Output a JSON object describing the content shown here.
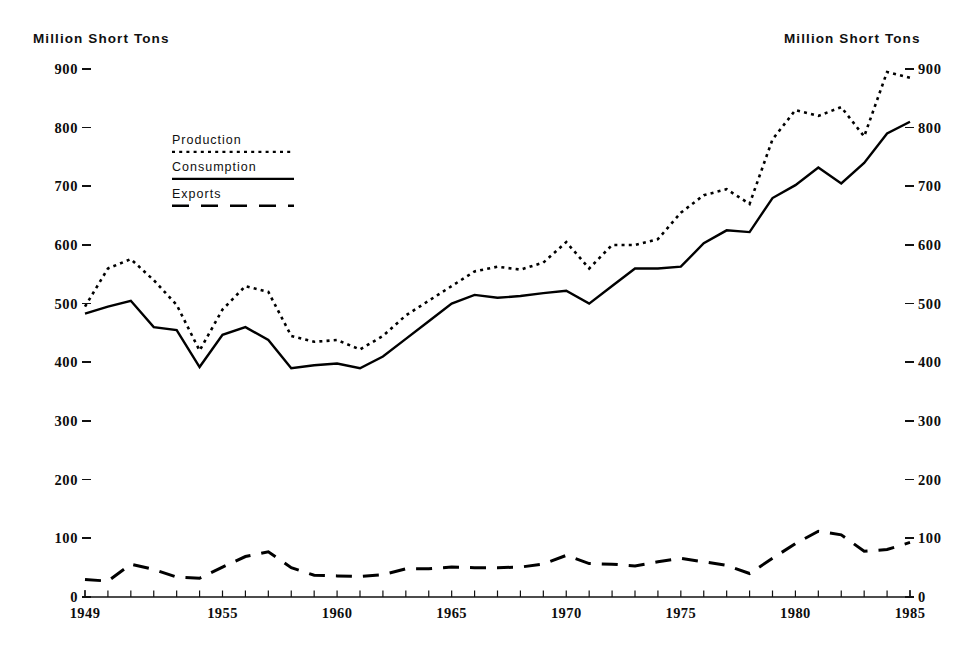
{
  "axis_titles": {
    "left": "Million Short Tons",
    "right": "Million Short Tons"
  },
  "legend": {
    "items": [
      {
        "label": "Production",
        "style": "dotted",
        "color": "#000000"
      },
      {
        "label": "Consumption",
        "style": "solid",
        "color": "#000000"
      },
      {
        "label": "Exports",
        "style": "dashed",
        "color": "#000000"
      }
    ]
  },
  "y_axis": {
    "ticks": [
      "0",
      "100",
      "200",
      "300",
      "400",
      "500",
      "600",
      "700",
      "800",
      "900"
    ],
    "min": 0,
    "max": 900
  },
  "x_axis": {
    "labeled_ticks": [
      "1949",
      "1955",
      "1960",
      "1965",
      "1970",
      "1975",
      "1980",
      "1985"
    ],
    "min": 1949,
    "max": 1985
  },
  "chart_data": {
    "type": "line",
    "title": "",
    "subtitle": "",
    "xlabel": "",
    "ylabel": "Million Short Tons",
    "xlim": [
      1949,
      1985
    ],
    "ylim": [
      0,
      900
    ],
    "grid": false,
    "legend_position": "upper-left",
    "x": [
      1949,
      1950,
      1951,
      1952,
      1953,
      1954,
      1955,
      1956,
      1957,
      1958,
      1959,
      1960,
      1961,
      1962,
      1963,
      1964,
      1965,
      1966,
      1967,
      1968,
      1969,
      1970,
      1971,
      1972,
      1973,
      1974,
      1975,
      1976,
      1977,
      1978,
      1979,
      1980,
      1981,
      1982,
      1983,
      1984,
      1985
    ],
    "series": [
      {
        "name": "Production",
        "style": "dotted",
        "color": "#000000",
        "values": [
          495,
          560,
          576,
          540,
          498,
          420,
          490,
          530,
          520,
          445,
          435,
          438,
          422,
          445,
          480,
          505,
          530,
          555,
          563,
          558,
          570,
          605,
          560,
          600,
          600,
          610,
          655,
          685,
          695,
          670,
          780,
          830,
          820,
          835,
          785,
          895,
          885
        ]
      },
      {
        "name": "Consumption",
        "style": "solid",
        "color": "#000000",
        "values": [
          483,
          495,
          505,
          460,
          455,
          392,
          447,
          460,
          438,
          390,
          395,
          398,
          390,
          410,
          440,
          470,
          500,
          515,
          510,
          513,
          518,
          522,
          500,
          530,
          560,
          560,
          563,
          603,
          625,
          622,
          680,
          702,
          732,
          705,
          740,
          790,
          810
        ]
      },
      {
        "name": "Exports",
        "style": "dashed",
        "color": "#000000",
        "values": [
          30,
          27,
          56,
          47,
          34,
          32,
          51,
          69,
          77,
          50,
          37,
          36,
          35,
          38,
          48,
          48,
          51,
          50,
          50,
          51,
          56,
          71,
          57,
          56,
          53,
          60,
          66,
          60,
          54,
          40,
          66,
          91,
          112,
          106,
          78,
          81,
          93
        ]
      }
    ]
  },
  "icons": {
    "chart": "line-chart-icon"
  }
}
